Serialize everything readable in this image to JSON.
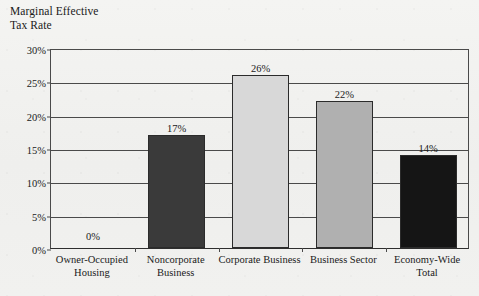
{
  "chart_data": {
    "type": "bar",
    "title": "Marginal Effective\nTax Rate",
    "xlabel": "",
    "ylabel": "Marginal Effective Tax Rate",
    "categories": [
      "Owner-Occupied\nHousing",
      "Noncorporate\nBusiness",
      "Corporate Business",
      "Business Sector",
      "Economy-Wide\nTotal"
    ],
    "values": [
      0,
      17,
      26,
      22,
      14
    ],
    "value_labels": [
      "0%",
      "17%",
      "26%",
      "22%",
      "14%"
    ],
    "bar_colors": [
      "#f2f2f0",
      "#3a3a3a",
      "#d8d8d8",
      "#b0b0b0",
      "#151515"
    ],
    "ylim": [
      0,
      30
    ],
    "yticks": [
      0,
      5,
      10,
      15,
      20,
      25,
      30
    ],
    "ytick_labels": [
      "0%",
      "5%",
      "10%",
      "15%",
      "20%",
      "25%",
      "30%"
    ],
    "grid": true,
    "legend": "none"
  }
}
